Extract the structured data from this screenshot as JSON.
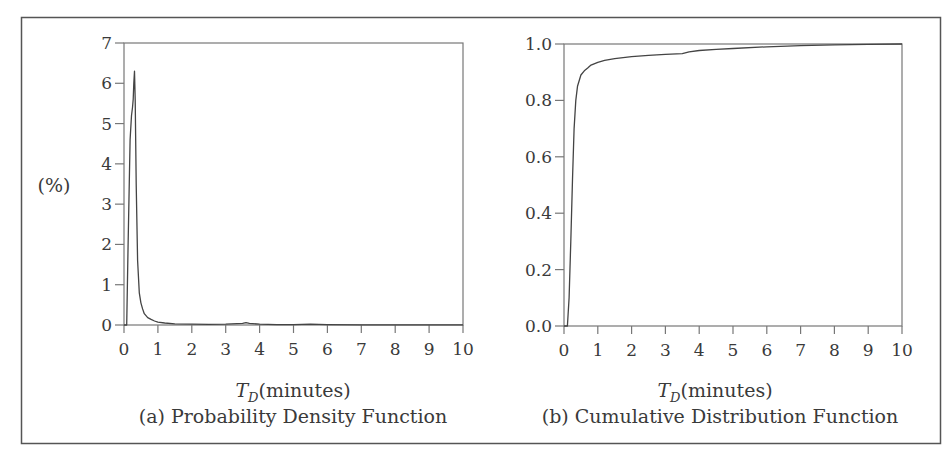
{
  "figure": {
    "frame_color": "#555555",
    "line_color": "#444444"
  },
  "chart_data": [
    {
      "id": "a",
      "type": "line",
      "title": "(a) Probability Density Function",
      "xlabel_var": "T",
      "xlabel_sub": "D",
      "xlabel_unit": "(minutes)",
      "ylabel": "(%)",
      "xlim": [
        0,
        10
      ],
      "ylim": [
        0,
        7
      ],
      "xticks": [
        "0",
        "1",
        "2",
        "3",
        "4",
        "5",
        "6",
        "7",
        "8",
        "9",
        "10"
      ],
      "yticks": [
        "0",
        "1",
        "2",
        "3",
        "4",
        "5",
        "6",
        "7"
      ],
      "grid": false,
      "legend": null,
      "series": [
        {
          "name": "PDF",
          "x": [
            0.0,
            0.08,
            0.12,
            0.18,
            0.22,
            0.25,
            0.27,
            0.29,
            0.31,
            0.33,
            0.36,
            0.4,
            0.45,
            0.5,
            0.55,
            0.6,
            0.7,
            0.8,
            0.9,
            1.0,
            1.2,
            1.5,
            2.0,
            2.5,
            3.0,
            3.5,
            3.6,
            3.7,
            4.0,
            4.5,
            5.0,
            5.5,
            6.0,
            7.0,
            8.0,
            9.0,
            10.0
          ],
          "y": [
            0.0,
            0.0,
            2.0,
            4.6,
            5.2,
            5.4,
            5.6,
            6.0,
            6.3,
            5.6,
            3.5,
            1.6,
            0.8,
            0.55,
            0.4,
            0.28,
            0.18,
            0.14,
            0.1,
            0.07,
            0.05,
            0.03,
            0.02,
            0.015,
            0.02,
            0.04,
            0.06,
            0.04,
            0.02,
            0.01,
            0.01,
            0.02,
            0.01,
            0.005,
            0.005,
            0.005,
            0.005
          ]
        }
      ]
    },
    {
      "id": "b",
      "type": "line",
      "title": "(b) Cumulative Distribution Function",
      "xlabel_var": "T",
      "xlabel_sub": "D",
      "xlabel_unit": "(minutes)",
      "ylabel": "",
      "xlim": [
        0,
        10
      ],
      "ylim": [
        0.0,
        1.0
      ],
      "xticks": [
        "0",
        "1",
        "2",
        "3",
        "4",
        "5",
        "6",
        "7",
        "8",
        "9",
        "10"
      ],
      "yticks": [
        "0.0",
        "0.2",
        "0.4",
        "0.6",
        "0.8",
        "1.0"
      ],
      "grid": false,
      "legend": null,
      "series": [
        {
          "name": "CDF",
          "x": [
            0.0,
            0.1,
            0.15,
            0.2,
            0.25,
            0.3,
            0.35,
            0.4,
            0.5,
            0.6,
            0.7,
            0.8,
            1.0,
            1.2,
            1.5,
            2.0,
            2.5,
            3.0,
            3.5,
            3.7,
            4.0,
            4.5,
            5.0,
            6.0,
            7.0,
            8.0,
            9.0,
            10.0
          ],
          "y": [
            0.0,
            0.0,
            0.1,
            0.3,
            0.52,
            0.7,
            0.8,
            0.85,
            0.89,
            0.905,
            0.915,
            0.925,
            0.935,
            0.942,
            0.948,
            0.955,
            0.96,
            0.963,
            0.966,
            0.972,
            0.977,
            0.981,
            0.984,
            0.99,
            0.994,
            0.997,
            0.999,
            1.0
          ]
        }
      ]
    }
  ]
}
